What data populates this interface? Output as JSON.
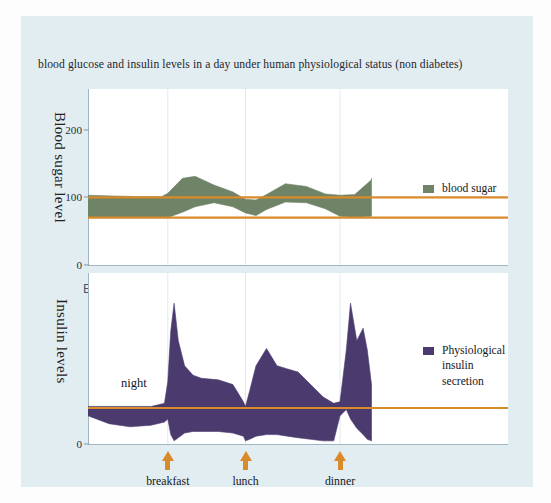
{
  "figure": {
    "title": "blood glucose and insulin levels in a day under human physiological status (non diabetes)",
    "panel_letter_b": "B",
    "background_color": "#e2edf1",
    "plot_background_color": "#ffffff"
  },
  "colors": {
    "blood_sugar_band": "#6f8466",
    "insulin_band": "#4a3a6d",
    "reference_line": "#d98a2b",
    "arrow": "#d98a2b",
    "axis": "#9fb7c4",
    "gridline": "#dfeaf0"
  },
  "annotations": {
    "night": "night"
  },
  "meals": [
    {
      "label": "breakfast",
      "x": 0.19
    },
    {
      "label": "lunch",
      "x": 0.375
    },
    {
      "label": "dinner",
      "x": 0.6
    }
  ],
  "chart_data": [
    {
      "id": "panel-a-blood-sugar",
      "type": "area",
      "title": "Blood sugar level over a day (non-diabetic)",
      "ylabel": "Blood sugar level",
      "xlabel": "",
      "ylim": [
        0,
        260
      ],
      "yticks": [
        0,
        100,
        200
      ],
      "ytick_labels": [
        "0",
        "100",
        "200"
      ],
      "grid": "vertical-only",
      "legend": {
        "position": "right",
        "entries": [
          "blood sugar"
        ]
      },
      "reference_lines": [
        {
          "value": 100,
          "label": "upper normal",
          "color": "#d98a2b"
        },
        {
          "value": 70,
          "label": "lower normal",
          "color": "#d98a2b"
        }
      ],
      "series": [
        {
          "name": "blood sugar upper bound",
          "x": [
            0.0,
            0.06,
            0.12,
            0.175,
            0.19,
            0.225,
            0.255,
            0.3,
            0.345,
            0.375,
            0.4,
            0.425,
            0.47,
            0.52,
            0.565,
            0.6,
            0.635,
            0.675,
            0.675
          ],
          "values": [
            103,
            102,
            101,
            101,
            106,
            128,
            131,
            118,
            108,
            97,
            96,
            104,
            120,
            116,
            105,
            103,
            104,
            126,
            128
          ]
        },
        {
          "name": "blood sugar lower bound",
          "x": [
            0.0,
            0.06,
            0.12,
            0.175,
            0.19,
            0.225,
            0.255,
            0.3,
            0.345,
            0.375,
            0.4,
            0.425,
            0.47,
            0.52,
            0.565,
            0.6,
            0.635,
            0.675,
            0.675
          ],
          "values": [
            70,
            70,
            70,
            70,
            70,
            78,
            86,
            92,
            86,
            77,
            73,
            82,
            93,
            92,
            83,
            72,
            70,
            72,
            72
          ]
        }
      ]
    },
    {
      "id": "panel-b-insulin",
      "type": "area",
      "title": "Physiological insulin secretion over a day",
      "ylabel": "Insulin levels",
      "xlabel": "",
      "ylim": [
        0,
        100
      ],
      "yticks": [
        0
      ],
      "ytick_labels": [
        "0"
      ],
      "grid": "vertical-only",
      "legend": {
        "position": "right",
        "entries": [
          "Physiological\ninsulin\nsecretion"
        ]
      },
      "reference_lines": [
        {
          "value": 23,
          "label": "basal insulin",
          "color": "#d98a2b"
        }
      ],
      "series": [
        {
          "name": "insulin upper bound",
          "x": [
            0.0,
            0.05,
            0.1,
            0.15,
            0.182,
            0.19,
            0.197,
            0.205,
            0.215,
            0.23,
            0.25,
            0.27,
            0.31,
            0.345,
            0.37,
            0.375,
            0.385,
            0.4,
            0.425,
            0.45,
            0.475,
            0.5,
            0.53,
            0.56,
            0.585,
            0.6,
            0.615,
            0.625,
            0.64,
            0.655,
            0.665,
            0.675
          ],
          "values": [
            24,
            24,
            24,
            24,
            26,
            40,
            72,
            90,
            66,
            50,
            44,
            42,
            41,
            38,
            27,
            24,
            34,
            50,
            61,
            50,
            48,
            46,
            38,
            30,
            26,
            27,
            60,
            90,
            66,
            74,
            60,
            38
          ]
        },
        {
          "name": "insulin lower bound",
          "x": [
            0.0,
            0.05,
            0.1,
            0.15,
            0.182,
            0.19,
            0.197,
            0.205,
            0.215,
            0.23,
            0.25,
            0.27,
            0.31,
            0.345,
            0.37,
            0.375,
            0.385,
            0.4,
            0.425,
            0.45,
            0.475,
            0.5,
            0.53,
            0.56,
            0.585,
            0.6,
            0.615,
            0.625,
            0.64,
            0.655,
            0.665,
            0.675
          ],
          "values": [
            18,
            13,
            11,
            12,
            14,
            16,
            6,
            2,
            4,
            7,
            8,
            8,
            8,
            7,
            5,
            2,
            3,
            5,
            6,
            6,
            5,
            4,
            3,
            2,
            2,
            18,
            22,
            16,
            10,
            6,
            3,
            2
          ]
        }
      ]
    }
  ]
}
